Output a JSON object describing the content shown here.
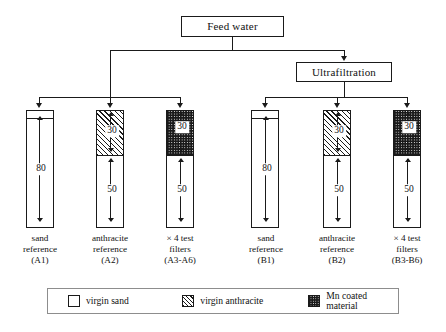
{
  "figure": {
    "nodes": {
      "feed_water": "Feed water",
      "ultrafiltration": "Ultrafiltration"
    },
    "columns": [
      {
        "id": "A1",
        "caption_line1": "sand",
        "caption_line2": "reference",
        "caption_line3": "(A1)",
        "segments": [
          {
            "material": "virgin sand",
            "depth": "80"
          }
        ]
      },
      {
        "id": "A2",
        "caption_line1": "anthracite",
        "caption_line2": "reference",
        "caption_line3": "(A2)",
        "segments": [
          {
            "material": "virgin anthracite",
            "depth": "30"
          },
          {
            "material": "virgin sand",
            "depth": "50"
          }
        ]
      },
      {
        "id": "A3-A6",
        "caption_line1": "× 4 test",
        "caption_line2": "filters",
        "caption_line3": "(A3-A6)",
        "segments": [
          {
            "material": "Mn coated material",
            "depth": "30"
          },
          {
            "material": "virgin sand",
            "depth": "50"
          }
        ]
      },
      {
        "id": "B1",
        "caption_line1": "sand",
        "caption_line2": "reference",
        "caption_line3": "(B1)",
        "segments": [
          {
            "material": "virgin sand",
            "depth": "80"
          }
        ]
      },
      {
        "id": "B2",
        "caption_line1": "anthracite",
        "caption_line2": "reference",
        "caption_line3": "(B2)",
        "segments": [
          {
            "material": "virgin anthracite",
            "depth": "30"
          },
          {
            "material": "virgin sand",
            "depth": "50"
          }
        ]
      },
      {
        "id": "B3-B6",
        "caption_line1": "× 4 test",
        "caption_line2": "filters",
        "caption_line3": "(B3-B6)",
        "segments": [
          {
            "material": "Mn coated material",
            "depth": "30"
          },
          {
            "material": "virgin sand",
            "depth": "50"
          }
        ]
      }
    ],
    "legend": [
      {
        "swatch": "virgin-sand-swatch",
        "label": "virgin sand"
      },
      {
        "swatch": "virgin-anthracite-swatch",
        "label": "virgin anthracite"
      },
      {
        "swatch": "mn-coated-material-swatch",
        "label": "Mn coated material"
      }
    ],
    "colors": {
      "line": "#1a1a1a",
      "fill": "#ffffff",
      "legend_border": "#8d8d8d"
    }
  }
}
